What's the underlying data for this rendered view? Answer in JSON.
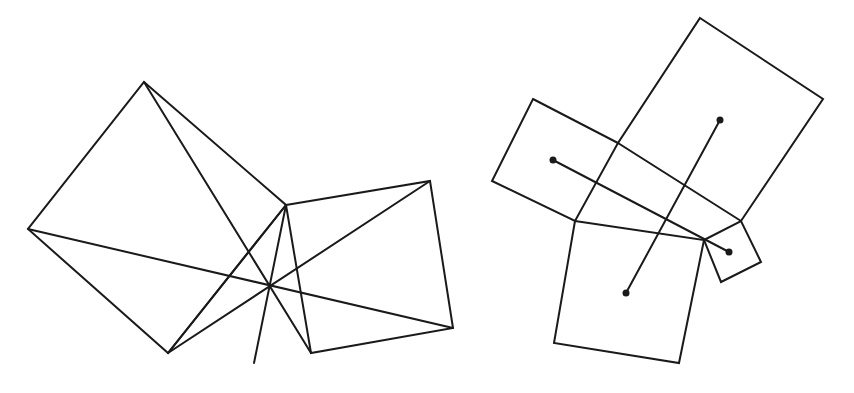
{
  "canvas": {
    "width": 854,
    "height": 393,
    "background": "#ffffff",
    "stroke_color": "#1a1a1a"
  },
  "figures": [
    {
      "name": "euclid-proof-figure",
      "description": "Pythagorean theorem proof figure: two squares on the sides of a right triangle with diagonals meeting at a point",
      "polygons": [
        {
          "name": "large-square",
          "points": "144,82 286,205 168,353 28,229"
        },
        {
          "name": "small-square",
          "points": "286,205 430,181 453,328 311,353"
        }
      ],
      "lines": [
        {
          "name": "diagonal-top-to-right-bottom",
          "x1": 144,
          "y1": 82,
          "x2": 311,
          "y2": 353
        },
        {
          "name": "diagonal-left-to-far-right",
          "x1": 28,
          "y1": 229,
          "x2": 453,
          "y2": 328
        },
        {
          "name": "line-bottom-to-vertex",
          "x1": 168,
          "y1": 353,
          "x2": 286,
          "y2": 205
        },
        {
          "name": "line-bottom-to-top-right",
          "x1": 168,
          "y1": 353,
          "x2": 430,
          "y2": 181
        },
        {
          "name": "line-vertex-through-center",
          "x1": 286,
          "y1": 205,
          "x2": 254,
          "y2": 363
        }
      ],
      "points": []
    },
    {
      "name": "four-squares-figure",
      "description": "Four squares on the sides of a quadrilateral with segments joining centers of opposite squares",
      "polygons": [
        {
          "name": "top-square",
          "points": "700,18 823,99 741,221 618,143"
        },
        {
          "name": "left-square",
          "points": "533,99 618,143 575,221 492,181"
        },
        {
          "name": "bottom-square",
          "points": "575,221 704,240 679,363 554,343"
        },
        {
          "name": "right-small-square",
          "points": "704,240 741,221 761,262 721,282"
        }
      ],
      "lines": [
        {
          "name": "segment-left-to-right-centers",
          "x1": 553,
          "y1": 160,
          "x2": 729,
          "y2": 252
        },
        {
          "name": "segment-top-to-bottom-centers",
          "x1": 720,
          "y1": 120,
          "x2": 626,
          "y2": 293
        }
      ],
      "points": [
        {
          "name": "center-left-square",
          "cx": 553,
          "cy": 160
        },
        {
          "name": "center-top-square",
          "cx": 720,
          "cy": 120
        },
        {
          "name": "center-right-square",
          "cx": 729,
          "cy": 252
        },
        {
          "name": "center-bottom-square",
          "cx": 626,
          "cy": 293
        }
      ]
    }
  ]
}
